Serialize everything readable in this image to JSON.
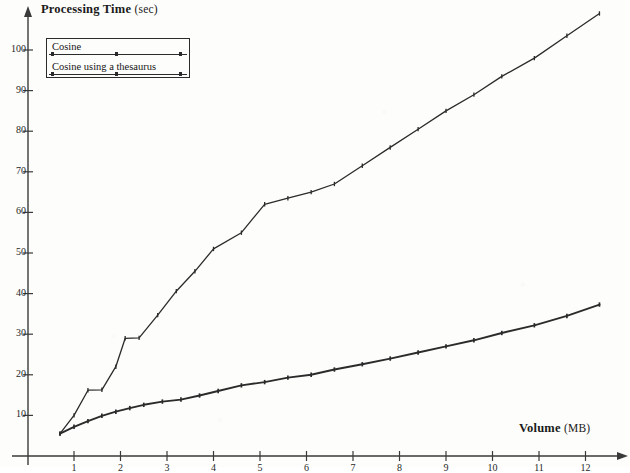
{
  "chart_data": {
    "type": "line",
    "title": "",
    "xlabel": "Volume (MB)",
    "ylabel": "Processing Time (sec)",
    "xlim": [
      0,
      12.9
    ],
    "ylim": [
      0,
      112
    ],
    "grid": false,
    "legend_position": "top-left",
    "xticks": [
      1,
      2,
      3,
      4,
      5,
      6,
      7,
      8,
      9,
      10,
      11,
      12
    ],
    "yticks": [
      10,
      20,
      30,
      40,
      50,
      60,
      70,
      80,
      90,
      100
    ],
    "series": [
      {
        "name": "Cosine",
        "x": [
          0.7,
          1.0,
          1.3,
          1.6,
          1.9,
          2.2,
          2.5,
          2.9,
          3.3,
          3.7,
          4.1,
          4.6,
          5.1,
          5.6,
          6.1,
          6.6,
          7.2,
          7.8,
          8.4,
          9.0,
          9.6,
          10.2,
          10.9,
          11.6,
          12.3
        ],
        "y": [
          5.5,
          7.2,
          8.6,
          9.9,
          10.9,
          11.8,
          12.6,
          13.4,
          13.9,
          14.9,
          16.0,
          17.4,
          18.2,
          19.3,
          20.0,
          21.3,
          22.6,
          24.0,
          25.5,
          27.0,
          28.5,
          30.3,
          32.2,
          34.5,
          37.3
        ]
      },
      {
        "name": "Cosine using a thesaurus",
        "x": [
          0.7,
          1.0,
          1.3,
          1.6,
          1.9,
          2.1,
          2.4,
          2.8,
          3.2,
          3.6,
          4.0,
          4.6,
          5.1,
          5.6,
          6.1,
          6.6,
          7.2,
          7.8,
          8.4,
          9.0,
          9.6,
          10.2,
          10.9,
          11.6,
          12.3
        ],
        "y": [
          5.5,
          10.0,
          16.2,
          16.3,
          22.0,
          29.0,
          29.1,
          34.7,
          40.6,
          45.5,
          51.0,
          55.0,
          62.0,
          63.5,
          65.0,
          67.0,
          71.5,
          76.0,
          80.5,
          85.0,
          89.0,
          93.5,
          98.0,
          103.5,
          109.0
        ]
      }
    ]
  },
  "legend": {
    "entries": [
      {
        "label": "Cosine"
      },
      {
        "label": "Cosine using a thesaurus"
      }
    ]
  },
  "axes": {
    "y_title_main": "Processing Time",
    "y_title_unit": "(sec)",
    "x_title_main": "Volume",
    "x_title_unit": "(MB)"
  },
  "style": {
    "line_color": "#2b2b2b",
    "axis_color": "#3a3a3a",
    "background": "#fdfdfb",
    "text_color": "#1a1a1a"
  }
}
